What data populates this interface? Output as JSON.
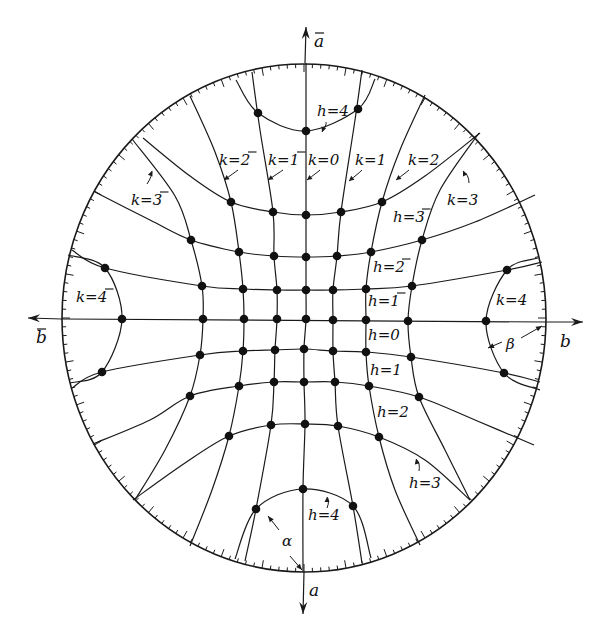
{
  "figure": {
    "rim": {
      "cx": 304,
      "cy": 318,
      "rx": 242,
      "ry": 254
    },
    "ink_color": "#1a1a1a",
    "background": "#ffffff"
  },
  "axes": [
    {
      "name": "a-bar-axis",
      "label": "a",
      "bar": true,
      "from": [
        305,
        63
      ],
      "to": [
        306,
        27
      ],
      "label_pos": [
        314,
        47
      ]
    },
    {
      "name": "a-axis",
      "label": "a",
      "bar": false,
      "from": [
        304,
        572
      ],
      "to": [
        303,
        614
      ],
      "label_pos": [
        309,
        596
      ]
    },
    {
      "name": "b-bar-axis",
      "label": "b",
      "bar": true,
      "from": [
        62,
        319
      ],
      "to": [
        28,
        318
      ],
      "label_pos": [
        36,
        343
      ]
    },
    {
      "name": "b-axis",
      "label": "b",
      "bar": false,
      "from": [
        546,
        322
      ],
      "to": [
        583,
        322
      ],
      "label_pos": [
        560,
        347
      ]
    }
  ],
  "dots": [
    {
      "h": -4,
      "k": -1,
      "x": 258,
      "y": 113
    },
    {
      "h": -4,
      "k": 0,
      "x": 306,
      "y": 131
    },
    {
      "h": -4,
      "k": 1,
      "x": 358,
      "y": 109
    },
    {
      "h": -3,
      "k": -2,
      "x": 231,
      "y": 202
    },
    {
      "h": -3,
      "k": -1,
      "x": 273,
      "y": 212
    },
    {
      "h": -3,
      "k": 0,
      "x": 306,
      "y": 215
    },
    {
      "h": -3,
      "k": 1,
      "x": 341,
      "y": 212
    },
    {
      "h": -3,
      "k": 2,
      "x": 382,
      "y": 202
    },
    {
      "h": -2,
      "k": -3,
      "x": 191,
      "y": 240
    },
    {
      "h": -2,
      "k": -2,
      "x": 239,
      "y": 252
    },
    {
      "h": -2,
      "k": -1,
      "x": 274,
      "y": 256
    },
    {
      "h": -2,
      "k": 0,
      "x": 306,
      "y": 257
    },
    {
      "h": -2,
      "k": 1,
      "x": 337,
      "y": 256
    },
    {
      "h": -2,
      "k": 2,
      "x": 371,
      "y": 252
    },
    {
      "h": -2,
      "k": 3,
      "x": 422,
      "y": 240
    },
    {
      "h": -1,
      "k": -4,
      "x": 105,
      "y": 268
    },
    {
      "h": -1,
      "k": -3,
      "x": 202,
      "y": 286
    },
    {
      "h": -1,
      "k": -2,
      "x": 243,
      "y": 289
    },
    {
      "h": -1,
      "k": -1,
      "x": 277,
      "y": 290
    },
    {
      "h": -1,
      "k": 0,
      "x": 306,
      "y": 290
    },
    {
      "h": -1,
      "k": 1,
      "x": 333,
      "y": 290
    },
    {
      "h": -1,
      "k": 2,
      "x": 366,
      "y": 289
    },
    {
      "h": -1,
      "k": 3,
      "x": 412,
      "y": 286
    },
    {
      "h": -1,
      "k": 4,
      "x": 507,
      "y": 270
    },
    {
      "h": 0,
      "k": -4,
      "x": 122,
      "y": 319
    },
    {
      "h": 0,
      "k": -3,
      "x": 203,
      "y": 319
    },
    {
      "h": 0,
      "k": -2,
      "x": 244,
      "y": 319
    },
    {
      "h": 0,
      "k": -1,
      "x": 277,
      "y": 319
    },
    {
      "h": 0,
      "k": 0,
      "x": 306,
      "y": 319
    },
    {
      "h": 0,
      "k": 1,
      "x": 333,
      "y": 320
    },
    {
      "h": 0,
      "k": 2,
      "x": 366,
      "y": 320
    },
    {
      "h": 0,
      "k": 3,
      "x": 408,
      "y": 321
    },
    {
      "h": 0,
      "k": 4,
      "x": 486,
      "y": 321
    },
    {
      "h": 1,
      "k": -4,
      "x": 102,
      "y": 372
    },
    {
      "h": 1,
      "k": -3,
      "x": 200,
      "y": 355
    },
    {
      "h": 1,
      "k": -2,
      "x": 243,
      "y": 351
    },
    {
      "h": 1,
      "k": -1,
      "x": 275,
      "y": 350
    },
    {
      "h": 1,
      "k": 0,
      "x": 304,
      "y": 349
    },
    {
      "h": 1,
      "k": 1,
      "x": 333,
      "y": 351
    },
    {
      "h": 1,
      "k": 2,
      "x": 366,
      "y": 352
    },
    {
      "h": 1,
      "k": 3,
      "x": 411,
      "y": 357
    },
    {
      "h": 1,
      "k": 4,
      "x": 504,
      "y": 373
    },
    {
      "h": 2,
      "k": -3,
      "x": 190,
      "y": 396
    },
    {
      "h": 2,
      "k": -2,
      "x": 239,
      "y": 386
    },
    {
      "h": 2,
      "k": -1,
      "x": 274,
      "y": 382
    },
    {
      "h": 2,
      "k": 0,
      "x": 304,
      "y": 382
    },
    {
      "h": 2,
      "k": 1,
      "x": 335,
      "y": 382
    },
    {
      "h": 2,
      "k": 2,
      "x": 369,
      "y": 386
    },
    {
      "h": 2,
      "k": 3,
      "x": 419,
      "y": 397
    },
    {
      "h": 3,
      "k": -2,
      "x": 229,
      "y": 436
    },
    {
      "h": 3,
      "k": -1,
      "x": 271,
      "y": 425
    },
    {
      "h": 3,
      "k": 0,
      "x": 305,
      "y": 424
    },
    {
      "h": 3,
      "k": 1,
      "x": 338,
      "y": 426
    },
    {
      "h": 3,
      "k": 2,
      "x": 379,
      "y": 437
    },
    {
      "h": 4,
      "k": -1,
      "x": 256,
      "y": 509
    },
    {
      "h": 4,
      "k": 0,
      "x": 303,
      "y": 489
    },
    {
      "h": 4,
      "k": 1,
      "x": 353,
      "y": 506
    }
  ],
  "h_curves": [
    {
      "label": "h=4 (top, bar)",
      "points": [
        [
          236,
          80
        ],
        [
          258,
          113
        ],
        [
          306,
          131
        ],
        [
          358,
          109
        ],
        [
          375,
          79
        ]
      ]
    },
    {
      "label": "h=-3",
      "points": [
        [
          143,
          138
        ],
        [
          190,
          176
        ],
        [
          231,
          202
        ],
        [
          273,
          212
        ],
        [
          306,
          215
        ],
        [
          341,
          212
        ],
        [
          382,
          202
        ],
        [
          425,
          176
        ],
        [
          480,
          133
        ]
      ]
    },
    {
      "label": "h=-2",
      "points": [
        [
          95,
          192
        ],
        [
          150,
          220
        ],
        [
          191,
          240
        ],
        [
          239,
          252
        ],
        [
          274,
          256
        ],
        [
          306,
          257
        ],
        [
          337,
          256
        ],
        [
          371,
          252
        ],
        [
          422,
          240
        ],
        [
          475,
          222
        ],
        [
          535,
          195
        ]
      ]
    },
    {
      "label": "h=-1",
      "points": [
        [
          72,
          250
        ],
        [
          105,
          268
        ],
        [
          202,
          286
        ],
        [
          243,
          289
        ],
        [
          277,
          290
        ],
        [
          306,
          290
        ],
        [
          333,
          290
        ],
        [
          366,
          289
        ],
        [
          412,
          286
        ],
        [
          507,
          270
        ],
        [
          542,
          262
        ]
      ]
    },
    {
      "label": "h=0",
      "points": [
        [
          62,
          319
        ],
        [
          546,
          322
        ]
      ]
    },
    {
      "label": "h=1",
      "points": [
        [
          72,
          388
        ],
        [
          102,
          372
        ],
        [
          200,
          355
        ],
        [
          243,
          351
        ],
        [
          275,
          350
        ],
        [
          304,
          349
        ],
        [
          333,
          351
        ],
        [
          366,
          352
        ],
        [
          411,
          357
        ],
        [
          504,
          373
        ],
        [
          540,
          382
        ]
      ]
    },
    {
      "label": "h=2",
      "points": [
        [
          93,
          444
        ],
        [
          150,
          420
        ],
        [
          190,
          396
        ],
        [
          239,
          386
        ],
        [
          274,
          382
        ],
        [
          304,
          382
        ],
        [
          335,
          382
        ],
        [
          369,
          386
        ],
        [
          419,
          397
        ],
        [
          475,
          420
        ],
        [
          534,
          445
        ]
      ]
    },
    {
      "label": "h=3",
      "points": [
        [
          133,
          500
        ],
        [
          185,
          463
        ],
        [
          229,
          436
        ],
        [
          271,
          425
        ],
        [
          305,
          424
        ],
        [
          338,
          426
        ],
        [
          379,
          437
        ],
        [
          425,
          460
        ],
        [
          470,
          500
        ]
      ]
    },
    {
      "label": "h=4 (bottom)",
      "points": [
        [
          235,
          559
        ],
        [
          256,
          509
        ],
        [
          303,
          489
        ],
        [
          353,
          506
        ],
        [
          371,
          558
        ]
      ]
    }
  ],
  "k_curves": [
    {
      "label": "k=-4",
      "points": [
        [
          68,
          255
        ],
        [
          105,
          268
        ],
        [
          122,
          319
        ],
        [
          102,
          372
        ],
        [
          70,
          383
        ]
      ]
    },
    {
      "label": "k=-3",
      "points": [
        [
          132,
          139
        ],
        [
          175,
          196
        ],
        [
          191,
          240
        ],
        [
          202,
          286
        ],
        [
          203,
          319
        ],
        [
          200,
          355
        ],
        [
          190,
          396
        ],
        [
          165,
          450
        ],
        [
          135,
          500
        ]
      ]
    },
    {
      "label": "k=-2",
      "points": [
        [
          190,
          96
        ],
        [
          215,
          152
        ],
        [
          231,
          202
        ],
        [
          239,
          252
        ],
        [
          243,
          289
        ],
        [
          244,
          319
        ],
        [
          243,
          351
        ],
        [
          239,
          386
        ],
        [
          229,
          436
        ],
        [
          212,
          490
        ],
        [
          190,
          546
        ]
      ]
    },
    {
      "label": "k=-1",
      "points": [
        [
          252,
          72
        ],
        [
          260,
          130
        ],
        [
          273,
          212
        ],
        [
          274,
          256
        ],
        [
          277,
          290
        ],
        [
          277,
          319
        ],
        [
          275,
          350
        ],
        [
          274,
          382
        ],
        [
          271,
          425
        ],
        [
          256,
          509
        ],
        [
          245,
          561
        ]
      ]
    },
    {
      "label": "k=0",
      "points": [
        [
          306,
          63
        ],
        [
          306,
          131
        ],
        [
          306,
          215
        ],
        [
          306,
          257
        ],
        [
          306,
          290
        ],
        [
          306,
          319
        ],
        [
          304,
          349
        ],
        [
          304,
          382
        ],
        [
          305,
          424
        ],
        [
          303,
          489
        ],
        [
          303,
          572
        ]
      ]
    },
    {
      "label": "k=1",
      "points": [
        [
          362,
          70
        ],
        [
          355,
          120
        ],
        [
          341,
          212
        ],
        [
          337,
          256
        ],
        [
          333,
          290
        ],
        [
          333,
          320
        ],
        [
          333,
          351
        ],
        [
          335,
          382
        ],
        [
          338,
          426
        ],
        [
          353,
          506
        ],
        [
          362,
          563
        ]
      ]
    },
    {
      "label": "k=2",
      "points": [
        [
          425,
          95
        ],
        [
          400,
          150
        ],
        [
          382,
          202
        ],
        [
          371,
          252
        ],
        [
          366,
          289
        ],
        [
          366,
          320
        ],
        [
          366,
          352
        ],
        [
          369,
          386
        ],
        [
          379,
          437
        ],
        [
          395,
          490
        ],
        [
          420,
          545
        ]
      ]
    },
    {
      "label": "k=3",
      "points": [
        [
          479,
          133
        ],
        [
          440,
          190
        ],
        [
          422,
          240
        ],
        [
          412,
          286
        ],
        [
          408,
          321
        ],
        [
          411,
          357
        ],
        [
          419,
          397
        ],
        [
          445,
          450
        ],
        [
          470,
          500
        ]
      ]
    },
    {
      "label": "k=4",
      "points": [
        [
          538,
          258
        ],
        [
          507,
          270
        ],
        [
          486,
          321
        ],
        [
          504,
          373
        ],
        [
          540,
          390
        ]
      ]
    }
  ],
  "rim_arcs": [
    {
      "label": "h=4 top rim arc",
      "points": [
        [
          236,
          80
        ],
        [
          258,
          113
        ],
        [
          306,
          131
        ],
        [
          358,
          109
        ],
        [
          375,
          79
        ]
      ]
    }
  ],
  "labels": [
    {
      "text": "h=4",
      "bar": false,
      "x": 317,
      "y": 116
    },
    {
      "text": "k=2",
      "bar": true,
      "bar_char": "2",
      "x": 219,
      "y": 165
    },
    {
      "text": "k=1",
      "bar": true,
      "bar_char": "1",
      "x": 268,
      "y": 165
    },
    {
      "text": "k=0",
      "bar": false,
      "x": 308,
      "y": 165
    },
    {
      "text": "k=1",
      "bar": false,
      "x": 355,
      "y": 165
    },
    {
      "text": "k=2",
      "bar": false,
      "x": 408,
      "y": 165
    },
    {
      "text": "k=3",
      "bar": true,
      "bar_char": "3",
      "x": 131,
      "y": 205
    },
    {
      "text": "k=3",
      "bar": false,
      "x": 447,
      "y": 205
    },
    {
      "text": "h=3",
      "bar": true,
      "bar_char": "3",
      "x": 393,
      "y": 222
    },
    {
      "text": "h=2",
      "bar": true,
      "bar_char": "2",
      "x": 373,
      "y": 272
    },
    {
      "text": "k=4",
      "bar": true,
      "bar_char": "4",
      "x": 76,
      "y": 302
    },
    {
      "text": "h=1",
      "bar": true,
      "bar_char": "1",
      "x": 368,
      "y": 306
    },
    {
      "text": "k=4",
      "bar": false,
      "x": 496,
      "y": 305
    },
    {
      "text": "h=0",
      "bar": false,
      "x": 368,
      "y": 340
    },
    {
      "text": "h=1",
      "bar": false,
      "x": 370,
      "y": 375
    },
    {
      "text": "h=2",
      "bar": false,
      "x": 377,
      "y": 417
    },
    {
      "text": "h=3",
      "bar": false,
      "x": 409,
      "y": 488
    },
    {
      "text": "h=4",
      "bar": false,
      "x": 308,
      "y": 520
    }
  ],
  "greek_labels": [
    {
      "name": "beta",
      "text": "β",
      "x": 506,
      "y": 349
    },
    {
      "name": "alpha",
      "text": "α",
      "x": 282,
      "y": 546
    }
  ],
  "pointers": [
    {
      "target": "h=4 top",
      "from": [
        326,
        122
      ],
      "to": [
        322,
        132
      ]
    },
    {
      "target": "k=-2",
      "from": [
        238,
        170
      ],
      "to": [
        224,
        180
      ]
    },
    {
      "target": "k=-1",
      "from": [
        283,
        170
      ],
      "to": [
        268,
        180
      ]
    },
    {
      "target": "k=0",
      "from": [
        320,
        170
      ],
      "to": [
        307,
        180
      ]
    },
    {
      "target": "k=1",
      "from": [
        362,
        170
      ],
      "to": [
        349,
        181
      ]
    },
    {
      "target": "k=2",
      "from": [
        409,
        170
      ],
      "to": [
        396,
        180
      ]
    },
    {
      "target": "k=-3",
      "from": [
        147,
        184
      ],
      "to": [
        152,
        171
      ]
    },
    {
      "target": "k=3",
      "from": [
        469,
        183
      ],
      "to": [
        463,
        171
      ]
    },
    {
      "target": "h=3",
      "from": [
        419,
        471
      ],
      "to": [
        416,
        459
      ]
    },
    {
      "target": "h=4 bottom",
      "from": [
        327,
        508
      ],
      "to": [
        327,
        497
      ]
    }
  ],
  "dimension_arrows": [
    {
      "name": "beta-arrow",
      "label": "β",
      "segments": [
        [
          [
            502,
            342
          ],
          [
            488,
            348
          ]
        ],
        [
          [
            521,
            338
          ],
          [
            542,
            326
          ]
        ]
      ]
    },
    {
      "name": "alpha-arrow",
      "label": "α",
      "segments": [
        [
          [
            279,
            530
          ],
          [
            268,
            516
          ]
        ],
        [
          [
            290,
            556
          ],
          [
            302,
            570
          ]
        ]
      ]
    }
  ],
  "ticks": {
    "minor_every_deg": 2,
    "major_every_deg": 10,
    "minor_len": 4,
    "major_len": 8
  }
}
